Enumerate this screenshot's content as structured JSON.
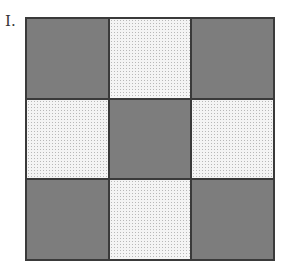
{
  "figure": {
    "label": "I.",
    "grid": {
      "rows": 3,
      "cols": 3,
      "pattern": [
        [
          "dark",
          "light",
          "dark"
        ],
        [
          "light",
          "dark",
          "light"
        ],
        [
          "dark",
          "light",
          "dark"
        ]
      ]
    },
    "colors": {
      "dark": "#7d7d7d",
      "light": "#f4f4f4",
      "border": "#3a3a3a"
    }
  }
}
